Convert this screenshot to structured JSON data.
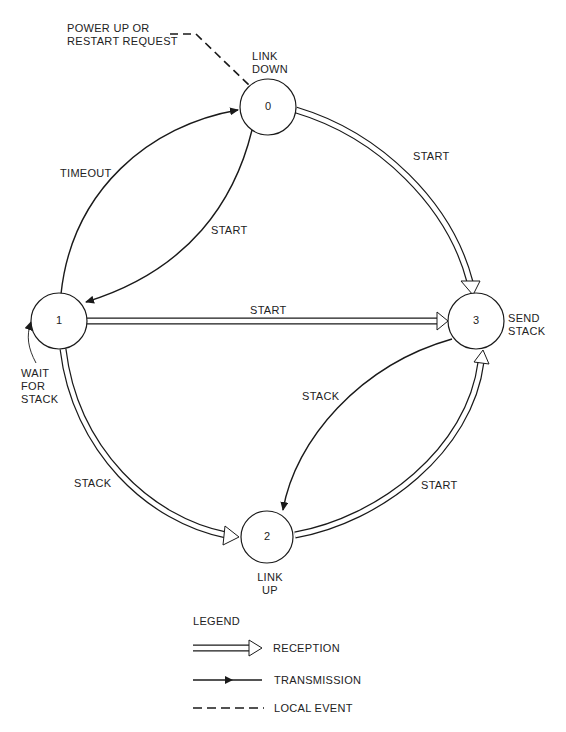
{
  "diagram": {
    "type": "state-transition",
    "states": [
      {
        "id": "0",
        "label": "0",
        "name": "LINK DOWN"
      },
      {
        "id": "1",
        "label": "1",
        "name": "WAIT FOR STACK"
      },
      {
        "id": "2",
        "label": "2",
        "name": "LINK UP"
      },
      {
        "id": "3",
        "label": "3",
        "name": "SEND STACK"
      }
    ],
    "state_names": {
      "s0_line1": "LINK",
      "s0_line2": "DOWN",
      "s1_line1": "WAIT",
      "s1_line2": "FOR",
      "s1_line3": "STACK",
      "s2_line1": "LINK",
      "s2_line2": "UP",
      "s3_line1": "SEND",
      "s3_line2": "STACK"
    },
    "local_event": {
      "line1": "POWER UP OR",
      "line2": "RESTART REQUEST",
      "target": "0"
    },
    "transitions": [
      {
        "from": "1",
        "to": "0",
        "label": "TIMEOUT",
        "kind": "transmission"
      },
      {
        "from": "0",
        "to": "1",
        "label": "START",
        "kind": "transmission"
      },
      {
        "from": "0",
        "to": "3",
        "label": "START",
        "kind": "reception"
      },
      {
        "from": "1",
        "to": "3",
        "label": "START",
        "kind": "reception"
      },
      {
        "from": "1",
        "to": "2",
        "label": "STACK",
        "kind": "reception"
      },
      {
        "from": "3",
        "to": "2",
        "label": "STACK",
        "kind": "transmission"
      },
      {
        "from": "2",
        "to": "3",
        "label": "START",
        "kind": "reception"
      }
    ],
    "edge_labels": {
      "timeout": "TIMEOUT",
      "start_0_1": "START",
      "start_0_3": "START",
      "start_1_3": "START",
      "stack_1_2": "STACK",
      "stack_3_2": "STACK",
      "start_2_3": "START"
    }
  },
  "legend": {
    "title": "LEGEND",
    "items": [
      {
        "label": "RECEPTION",
        "style": "double-line-hollow-arrow"
      },
      {
        "label": "TRANSMISSION",
        "style": "solid-line-arrow"
      },
      {
        "label": "LOCAL EVENT",
        "style": "dashed-line"
      }
    ]
  }
}
